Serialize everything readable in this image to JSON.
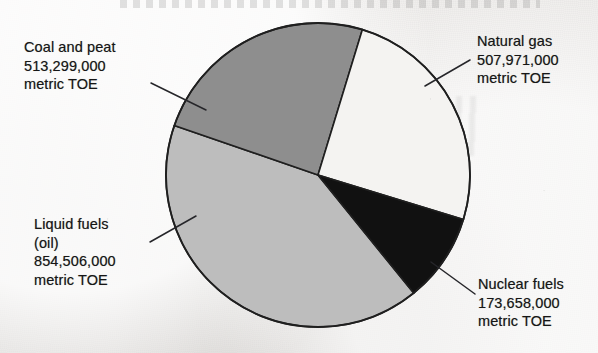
{
  "chart_data": {
    "type": "pie",
    "title": "",
    "subtitle": "",
    "xlabel": "",
    "ylabel": "",
    "unit": "metric TOE",
    "legend_position": "callout-labels",
    "grid": false,
    "categories": [
      "Coal and peat",
      "Natural gas",
      "Nuclear fuels",
      "Liquid fuels (oil)"
    ],
    "values": [
      513299000,
      507971000,
      173658000,
      854506000
    ],
    "value_labels": [
      "513,299,000",
      "507,971,000",
      "173,658,000",
      "854,506,000"
    ],
    "total": 2049434000,
    "slices": [
      {
        "name": "Coal and peat",
        "value": 513299000,
        "value_label": "513,299,000",
        "unit": "metric TOE",
        "percent": 25.0,
        "color": "#8e8e8e",
        "start_angle_deg": 289,
        "end_angle_deg": 377
      },
      {
        "name": "Natural gas",
        "value": 507971000,
        "value_label": "507,971,000",
        "unit": "metric TOE",
        "percent": 24.8,
        "color": "#f4f3f1",
        "start_angle_deg": 17,
        "end_angle_deg": 107
      },
      {
        "name": "Nuclear fuels",
        "value": 173658000,
        "value_label": "173,658,000",
        "unit": "metric TOE",
        "percent": 8.5,
        "color": "#111111",
        "start_angle_deg": 107,
        "end_angle_deg": 141
      },
      {
        "name": "Liquid fuels (oil)",
        "value": 854506000,
        "value_label": "854,506,000",
        "unit": "metric TOE",
        "percent": 41.7,
        "color": "#bdbdbd",
        "start_angle_deg": 141,
        "end_angle_deg": 289
      }
    ]
  },
  "labels": {
    "coal": {
      "line1": "Coal and peat",
      "line2": "513,299,000",
      "line3": "metric TOE"
    },
    "gas": {
      "line1": "Natural gas",
      "line2": "507,971,000",
      "line3": "metric TOE"
    },
    "liquid": {
      "line1": "Liquid fuels",
      "line2": "(oil)",
      "line3": "854,506,000",
      "line4": "metric TOE"
    },
    "nuclear": {
      "line1": "Nuclear fuels",
      "line2": "173,658,000",
      "line3": "metric TOE"
    }
  },
  "colors": {
    "coal_slice": "#8e8e8e",
    "gas_slice": "#f4f3f1",
    "nuclear_slice": "#111111",
    "liquid_slice": "#bdbdbd",
    "outline": "#1f1f1f",
    "text": "#161616",
    "background": "#eceae8"
  }
}
